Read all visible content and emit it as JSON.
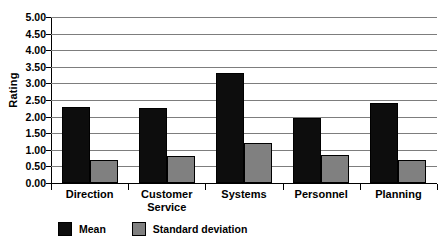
{
  "chart_data": {
    "type": "bar",
    "title": "",
    "xlabel": "",
    "ylabel": "Rating",
    "ylim": [
      0,
      5
    ],
    "ytick_step": 0.5,
    "grid": true,
    "legend_position": "bottom-left",
    "categories": [
      "Direction",
      "Customer\nService",
      "Systems",
      "Personnel",
      "Planning"
    ],
    "ytick_labels": [
      "5.00",
      "4.50",
      "4.00",
      "3.50",
      "3.00",
      "2.50",
      "2.00",
      "1.50",
      "1.00",
      "0.50",
      "0.00"
    ],
    "ytick_values": [
      5.0,
      4.5,
      4.0,
      3.5,
      3.0,
      2.5,
      2.0,
      1.5,
      1.0,
      0.5,
      0.0
    ],
    "series": [
      {
        "name": "Mean",
        "color": "#0d0d0d",
        "values": [
          2.3,
          2.25,
          3.3,
          1.95,
          2.4
        ]
      },
      {
        "name": "Standard deviation",
        "color": "#808080",
        "values": [
          0.7,
          0.8,
          1.2,
          0.85,
          0.7
        ]
      }
    ]
  },
  "legend": {
    "entries": [
      {
        "label": "Mean"
      },
      {
        "label": "Standard deviation"
      }
    ]
  }
}
